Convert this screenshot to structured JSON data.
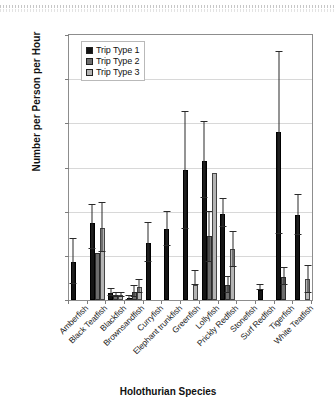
{
  "chart_data": {
    "type": "bar",
    "title": "",
    "subtitle": "",
    "xlabel": "Holothurian Species",
    "ylabel": "Number per Person per Hour",
    "ylim": [
      0.0,
      0.6
    ],
    "yticks": [
      "0.00",
      "0.10",
      "0.20",
      "0.30",
      "0.40",
      "0.50",
      "0.60"
    ],
    "ytick_values": [
      0.0,
      0.1,
      0.2,
      0.3,
      0.4,
      0.5,
      0.6
    ],
    "grid": "horizontal",
    "legend_position": "top-left-inside",
    "error_bars": "std-error",
    "categories": [
      "Amberfish",
      "Black Teatfish",
      "Blackfish",
      "Brownsandfish",
      "Curryfish",
      "Elephant trunkfish",
      "Greenfish",
      "Lollyfish",
      "Prickly Redfish",
      "Stonefish",
      "Surf Redfish",
      "Tigerfish",
      "White Teatfish"
    ],
    "series": [
      {
        "name": "Trip Type 1",
        "color": "#141414",
        "values": [
          0.086,
          0.175,
          0.017,
          0.004,
          0.13,
          0.16,
          0.295,
          0.315,
          0.195,
          0.0,
          0.022,
          0.38,
          0.192
        ],
        "err_low": [
          0.05,
          0.06,
          0.008,
          0.004,
          0.045,
          0.037,
          0.135,
          0.085,
          0.03,
          0.0,
          0.0,
          0.23,
          0.044
        ],
        "err_high": [
          0.052,
          0.04,
          0.008,
          0.004,
          0.045,
          0.04,
          0.13,
          0.088,
          0.033,
          0.0,
          0.013,
          0.182,
          0.045
        ]
      },
      {
        "name": "Trip Type 2",
        "color": "#6d6d6d",
        "values": [
          0.0,
          0.107,
          0.012,
          0.019,
          0.0,
          0.0,
          0.0,
          0.145,
          0.035,
          0.0,
          0.0,
          0.053,
          0.0
        ],
        "err_low": [
          0.0,
          0.0,
          0.005,
          0.012,
          0.0,
          0.0,
          0.0,
          0.06,
          0.019,
          0.0,
          0.0,
          0.02,
          0.0
        ],
        "err_high": [
          0.0,
          0.0,
          0.005,
          0.013,
          0.0,
          0.0,
          0.0,
          0.055,
          0.017,
          0.0,
          0.0,
          0.019,
          0.0
        ]
      },
      {
        "name": "Trip Type 3",
        "color": "#b4b4b4",
        "values": [
          0.0,
          0.163,
          0.012,
          0.03,
          0.0,
          0.0,
          0.033,
          0.287,
          0.115,
          0.0,
          0.0,
          0.0,
          0.047
        ],
        "err_low": [
          0.0,
          0.055,
          0.005,
          0.014,
          0.0,
          0.0,
          0.0,
          0.0,
          0.04,
          0.0,
          0.0,
          0.0,
          0.031
        ],
        "err_high": [
          0.0,
          0.056,
          0.005,
          0.015,
          0.0,
          0.0,
          0.033,
          0.0,
          0.04,
          0.0,
          0.0,
          0.0,
          0.03
        ]
      }
    ]
  },
  "legend": {
    "items": [
      {
        "label": "Trip Type 1",
        "color": "#141414"
      },
      {
        "label": "Trip Type 2",
        "color": "#6d6d6d"
      },
      {
        "label": "Trip Type 3",
        "color": "#b4b4b4"
      }
    ]
  },
  "axes": {
    "y_title": "Number per Person per Hour",
    "x_title": "Holothurian Species"
  }
}
